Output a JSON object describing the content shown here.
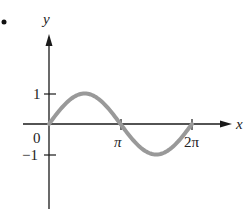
{
  "chart_data": {
    "type": "line",
    "title": "",
    "xlabel": "x",
    "ylabel": "y",
    "function": "y = sin(x)",
    "x_domain": [
      0,
      6.2832
    ],
    "xlim": [
      -0.4,
      7.0
    ],
    "ylim": [
      -2.2,
      2.0
    ],
    "x_ticks": [
      {
        "value": 3.1416,
        "label": "π"
      },
      {
        "value": 6.2832,
        "label": "2π"
      }
    ],
    "y_ticks": [
      {
        "value": 1,
        "label": "1"
      },
      {
        "value": -1,
        "label": "−1"
      }
    ],
    "origin_label": "0",
    "series": [
      {
        "name": "sin x",
        "color": "#999999",
        "x": [
          0,
          0.7854,
          1.5708,
          2.3562,
          3.1416,
          3.927,
          4.7124,
          5.4978,
          6.2832
        ],
        "y": [
          0,
          0.707,
          1,
          0.707,
          0,
          -0.707,
          -1,
          -0.707,
          0
        ]
      }
    ],
    "grid": false,
    "legend": "none"
  },
  "labels": {
    "bullet": "•",
    "y_axis": "y",
    "x_axis": "x",
    "origin": "0",
    "tick_y_pos": "1",
    "tick_y_neg": "−1",
    "tick_pi": "π",
    "tick_2pi": "2π"
  },
  "colors": {
    "axis": "#1a1a1a",
    "curve": "#999999"
  }
}
